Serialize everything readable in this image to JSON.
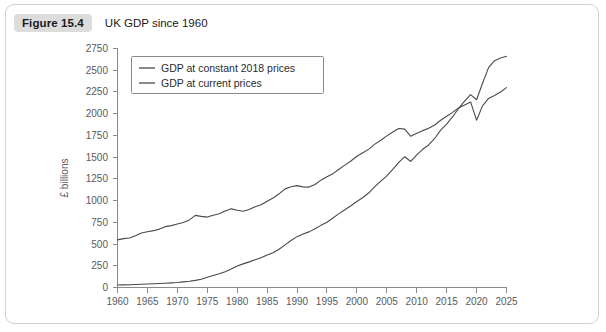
{
  "figure": {
    "badge": "Figure 15.4",
    "title": "UK GDP since 1960"
  },
  "chart_data": {
    "type": "line",
    "title": "UK GDP since 1960",
    "xlabel": "",
    "ylabel": "£ billions",
    "xlim": [
      1960,
      2025
    ],
    "ylim": [
      0,
      2750
    ],
    "ytick_step": 250,
    "xtick_step": 5,
    "grid": false,
    "legend_position": "top-left-inside",
    "xticks": [
      1960,
      1965,
      1970,
      1975,
      1980,
      1985,
      1990,
      1995,
      2000,
      2005,
      2010,
      2015,
      2020,
      2025
    ],
    "yticks": [
      0,
      250,
      500,
      750,
      1000,
      1250,
      1500,
      1750,
      2000,
      2250,
      2500,
      2750
    ],
    "line_color": "#4a4a4a",
    "x": [
      1960,
      1961,
      1962,
      1963,
      1964,
      1965,
      1966,
      1967,
      1968,
      1969,
      1970,
      1971,
      1972,
      1973,
      1974,
      1975,
      1976,
      1977,
      1978,
      1979,
      1980,
      1981,
      1982,
      1983,
      1984,
      1985,
      1986,
      1987,
      1988,
      1989,
      1990,
      1991,
      1992,
      1993,
      1994,
      1995,
      1996,
      1997,
      1998,
      1999,
      2000,
      2001,
      2002,
      2003,
      2004,
      2005,
      2006,
      2007,
      2008,
      2009,
      2010,
      2011,
      2012,
      2013,
      2014,
      2015,
      2016,
      2017,
      2018,
      2019,
      2020,
      2021,
      2022,
      2023,
      2024,
      2025
    ],
    "series": [
      {
        "name": "GDP at constant 2018 prices",
        "values": [
          548,
          562,
          570,
          596,
          628,
          642,
          654,
          672,
          700,
          712,
          730,
          748,
          778,
          830,
          818,
          810,
          832,
          848,
          880,
          905,
          888,
          878,
          898,
          930,
          952,
          992,
          1030,
          1078,
          1135,
          1160,
          1172,
          1158,
          1155,
          1185,
          1235,
          1275,
          1310,
          1360,
          1408,
          1455,
          1510,
          1550,
          1592,
          1650,
          1695,
          1745,
          1790,
          1830,
          1822,
          1740,
          1775,
          1805,
          1832,
          1870,
          1925,
          1970,
          2015,
          2065,
          2100,
          2135,
          1925,
          2090,
          2175,
          2210,
          2250,
          2300
        ]
      },
      {
        "name": "GDP at current prices",
        "values": [
          28,
          30,
          32,
          34,
          37,
          40,
          43,
          46,
          49,
          53,
          58,
          65,
          72,
          82,
          94,
          118,
          138,
          158,
          182,
          212,
          248,
          272,
          295,
          320,
          342,
          375,
          400,
          440,
          490,
          540,
          585,
          615,
          640,
          675,
          715,
          750,
          800,
          850,
          895,
          940,
          990,
          1035,
          1090,
          1160,
          1225,
          1285,
          1360,
          1440,
          1505,
          1450,
          1525,
          1590,
          1640,
          1715,
          1810,
          1880,
          1965,
          2060,
          2145,
          2220,
          2160,
          2350,
          2530,
          2610,
          2640,
          2660
        ]
      }
    ],
    "legend": [
      "GDP at constant 2018 prices",
      "GDP at current prices"
    ]
  }
}
